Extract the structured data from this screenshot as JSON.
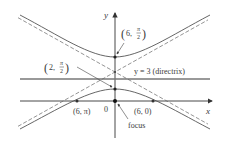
{
  "diagram": {
    "type": "polar-conic-hyperbola",
    "axes": {
      "x_label": "x",
      "y_label": "y",
      "origin_label": "0"
    },
    "directrix": {
      "label": "y = 3 (directrix)"
    },
    "points": [
      {
        "id": "upper-vertex",
        "label_main": "6, ",
        "label_frac_num": "π",
        "label_frac_den": "2"
      },
      {
        "id": "lower-vertex",
        "label_main": "2, ",
        "label_frac_num": "π",
        "label_frac_den": "2"
      },
      {
        "id": "left-x-intercept",
        "label": "(6, π)"
      },
      {
        "id": "right-x-intercept",
        "label": "(6, 0)"
      }
    ],
    "focus_label": "focus",
    "colors": {
      "curve": "#555555",
      "axis": "#333333",
      "point": "#222222"
    }
  }
}
